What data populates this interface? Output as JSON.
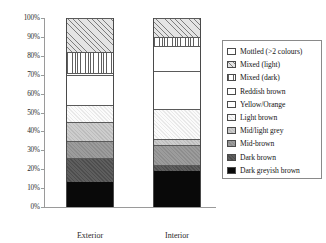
{
  "chart_data": {
    "type": "bar",
    "title": "",
    "subtitle": "",
    "xlabel": "",
    "ylabel": "",
    "stacked": true,
    "normalized_percent": true,
    "grid": false,
    "legend_position": "right",
    "ylim": [
      0,
      100
    ],
    "ytick_labels": [
      "100%",
      "90%",
      "80%",
      "70%",
      "60%",
      "50%",
      "40%",
      "30%",
      "20%",
      "10%",
      "0%"
    ],
    "ytick_values": [
      100,
      90,
      80,
      70,
      60,
      50,
      40,
      30,
      20,
      10,
      0
    ],
    "categories": [
      "Exterior",
      "Interior"
    ],
    "series": [
      {
        "name": "Dark greyish brown",
        "swatch": "solid-black",
        "color": "#090909",
        "values": [
          13,
          19
        ]
      },
      {
        "name": "Dark brown",
        "swatch": "hatch-dark-grey",
        "color": "#555555",
        "values": [
          13,
          3
        ]
      },
      {
        "name": "Mid-brown",
        "swatch": "hatch-mid-grey",
        "color": "#949494",
        "values": [
          9,
          11
        ]
      },
      {
        "name": "Mid/light grey",
        "swatch": "hatch-light-grey",
        "color": "#c5c5c5",
        "values": [
          10,
          3
        ]
      },
      {
        "name": "Light brown",
        "swatch": "hatch-very-light",
        "color": "#f2f2f2",
        "values": [
          9,
          16
        ]
      },
      {
        "name": "Yellow/Orange",
        "swatch": "white",
        "color": "#ffffff",
        "values": [
          16,
          20
        ]
      },
      {
        "name": "Reddish brown",
        "swatch": "white",
        "color": "#ffffff",
        "values": [
          1,
          13
        ]
      },
      {
        "name": "Mixed (dark)",
        "swatch": "vertical-stripes",
        "color": "#5f5f5f",
        "values": [
          11,
          5
        ]
      },
      {
        "name": "Mixed (light)",
        "swatch": "diagonal-hatch",
        "color": "#c9c9c9",
        "values": [
          18,
          10
        ]
      },
      {
        "name": "Mottled (>2 colours)",
        "swatch": "white-dotted",
        "color": "#ffffff",
        "values": [
          0,
          0
        ]
      }
    ],
    "legend_order": [
      "Mottled (>2 colours)",
      "Mixed (light)",
      "Mixed (dark)",
      "Reddish brown",
      "Yellow/Orange",
      "Light brown",
      "Mid/light grey",
      "Mid-brown",
      "Dark brown",
      "Dark greyish brown"
    ]
  },
  "axis": {
    "ticks": [
      {
        "label": "100%",
        "value": 100
      },
      {
        "label": "90%",
        "value": 90
      },
      {
        "label": "80%",
        "value": 80
      },
      {
        "label": "70%",
        "value": 70
      },
      {
        "label": "60%",
        "value": 60
      },
      {
        "label": "50%",
        "value": 50
      },
      {
        "label": "40%",
        "value": 40
      },
      {
        "label": "30%",
        "value": 30
      },
      {
        "label": "20%",
        "value": 20
      },
      {
        "label": "10%",
        "value": 10
      },
      {
        "label": "0%",
        "value": 0
      }
    ],
    "categories": [
      {
        "label": "Exterior"
      },
      {
        "label": "Interior"
      }
    ]
  },
  "legend": {
    "items": [
      {
        "label": "Mottled (>2 colours)",
        "fill_class": "f-mottled",
        "name": "mottled"
      },
      {
        "label": "Mixed (light)",
        "fill_class": "f-mixed-light",
        "name": "mixed-light"
      },
      {
        "label": "Mixed (dark)",
        "fill_class": "f-mixed-dark",
        "name": "mixed-dark"
      },
      {
        "label": "Reddish brown",
        "fill_class": "f-reddish",
        "name": "reddish-brown"
      },
      {
        "label": "Yellow/Orange",
        "fill_class": "f-yellow",
        "name": "yellow-orange"
      },
      {
        "label": "Light brown",
        "fill_class": "f-lightbrown",
        "name": "light-brown"
      },
      {
        "label": "Mid/light grey",
        "fill_class": "f-midlightgrey",
        "name": "mid-light-grey"
      },
      {
        "label": "Mid-brown",
        "fill_class": "f-midbrown",
        "name": "mid-brown"
      },
      {
        "label": "Dark brown",
        "fill_class": "f-darkbrown",
        "name": "dark-brown"
      },
      {
        "label": "Dark greyish brown",
        "fill_class": "f-darkgreyish",
        "name": "dark-greyish-brown"
      }
    ]
  },
  "colors": {
    "axis": "#9a9a9a",
    "bar_outline": "#4a4a4a",
    "legend_border": "#8a8a8a",
    "text": "#1a1a1a",
    "background": "#ffffff"
  }
}
